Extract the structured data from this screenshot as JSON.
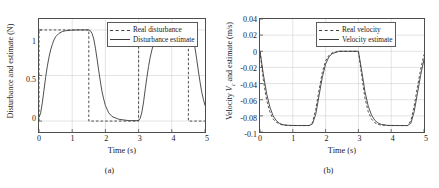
{
  "figure": {
    "panels": [
      {
        "id": "a",
        "caption": "(a)",
        "ylabel": "Disturbance and estimate (N)",
        "xlabel": "Time (s)",
        "yticks": [
          "0",
          "0.5",
          "1"
        ],
        "xticks": [
          "0",
          "1",
          "2",
          "3",
          "4",
          "5"
        ],
        "legend": [
          {
            "label": "Real disturbance",
            "style": "dashed"
          },
          {
            "label": "Disturbance estimate",
            "style": "solid"
          }
        ]
      },
      {
        "id": "b",
        "caption": "(b)",
        "ylabel_prefix": "Velocity ",
        "ylabel_symbol": "V",
        "ylabel_subscript": "c",
        "ylabel_suffix": " and estimate (m/s)",
        "xlabel": "Time (s)",
        "yticks": [
          "0.04",
          "0.02",
          "0",
          "-0.02",
          "-0.04",
          "-0.06",
          "-0.08",
          "-0.1"
        ],
        "xticks": [
          "0",
          "1",
          "2",
          "3",
          "4",
          "5"
        ],
        "legend": [
          {
            "label": "Real velocity",
            "style": "dashed"
          },
          {
            "label": "Velocity estimate",
            "style": "solid"
          }
        ]
      }
    ]
  },
  "colors": {
    "line": "#3c3c3c",
    "axis": "#4d4d4d",
    "grid": "#c8c8c8",
    "background": "#ffffff"
  },
  "chart_data": [
    {
      "type": "line",
      "title": "",
      "panel": "(a)",
      "xlabel": "Time (s)",
      "ylabel": "Disturbance and estimate (N)",
      "xlim": [
        0,
        5
      ],
      "ylim": [
        -0.12,
        1.12
      ],
      "xticks": [
        0,
        1,
        2,
        3,
        4,
        5
      ],
      "yticks": [
        0,
        0.5,
        1
      ],
      "grid": true,
      "legend_position": "top-right",
      "series": [
        {
          "name": "Real disturbance",
          "style": "dashed",
          "description": "Square wave: 1 on [0,1.5), 0 on [1.5,3), 1 on [3,4.5), 0 on [4.5,5]",
          "x": [
            0,
            0,
            1.5,
            1.5,
            3,
            3,
            4.5,
            4.5,
            5
          ],
          "y": [
            0,
            1,
            1,
            0,
            0,
            1,
            1,
            0,
            0
          ]
        },
        {
          "name": "Disturbance estimate",
          "style": "solid",
          "description": "Low-pass filtered square wave, rise/fall time about 0.55 s",
          "x": [
            0,
            0.05,
            0.1,
            0.15,
            0.2,
            0.25,
            0.3,
            0.35,
            0.4,
            0.45,
            0.5,
            0.6,
            0.7,
            0.8,
            1.0,
            1.2,
            1.5,
            1.55,
            1.6,
            1.65,
            1.7,
            1.75,
            1.8,
            1.85,
            1.9,
            1.95,
            2.0,
            2.1,
            2.2,
            2.4,
            2.7,
            3.0,
            3.05,
            3.1,
            3.15,
            3.2,
            3.25,
            3.3,
            3.35,
            3.4,
            3.45,
            3.5,
            3.6,
            3.7,
            3.9,
            4.2,
            4.5,
            4.55,
            4.6,
            4.65,
            4.7,
            4.75,
            4.8,
            4.85,
            4.9,
            4.95,
            5.0
          ],
          "y": [
            0.04,
            0.09,
            0.2,
            0.34,
            0.48,
            0.6,
            0.7,
            0.78,
            0.84,
            0.89,
            0.925,
            0.962,
            0.982,
            0.991,
            0.998,
            1.0,
            1.0,
            0.99,
            0.96,
            0.9,
            0.8,
            0.68,
            0.55,
            0.43,
            0.32,
            0.24,
            0.17,
            0.09,
            0.05,
            0.02,
            0.005,
            0.005,
            0.03,
            0.1,
            0.21,
            0.35,
            0.48,
            0.6,
            0.7,
            0.78,
            0.845,
            0.89,
            0.95,
            0.978,
            0.995,
            1.0,
            1.0,
            0.99,
            0.96,
            0.9,
            0.8,
            0.68,
            0.55,
            0.43,
            0.32,
            0.24,
            0.17
          ]
        }
      ]
    },
    {
      "type": "line",
      "title": "",
      "panel": "(b)",
      "xlabel": "Time (s)",
      "ylabel": "Velocity Vc and estimate (m/s)",
      "xlim": [
        0,
        5
      ],
      "ylim": [
        -0.1,
        0.04
      ],
      "xticks": [
        0,
        1,
        2,
        3,
        4,
        5
      ],
      "yticks": [
        0.04,
        0.02,
        0,
        -0.02,
        -0.04,
        -0.06,
        -0.08,
        -0.1
      ],
      "grid": true,
      "legend_position": "top-right",
      "series": [
        {
          "name": "Real velocity",
          "style": "dashed",
          "description": "Drops from 0 to -0.092 after each disturbance step, returns to 0",
          "x": [
            0,
            0.1,
            0.2,
            0.3,
            0.4,
            0.5,
            0.6,
            0.7,
            0.9,
            1.2,
            1.5,
            1.6,
            1.7,
            1.8,
            1.9,
            2.0,
            2.1,
            2.2,
            2.4,
            2.7,
            3.0,
            3.1,
            3.2,
            3.3,
            3.4,
            3.5,
            3.6,
            3.7,
            3.9,
            4.2,
            4.5,
            4.6,
            4.7,
            4.8,
            4.9,
            5.0
          ],
          "y": [
            0,
            -0.035,
            -0.06,
            -0.075,
            -0.084,
            -0.088,
            -0.09,
            -0.0915,
            -0.092,
            -0.092,
            -0.092,
            -0.088,
            -0.072,
            -0.048,
            -0.026,
            -0.012,
            -0.005,
            -0.002,
            0,
            0,
            0,
            -0.03,
            -0.058,
            -0.075,
            -0.084,
            -0.0885,
            -0.0905,
            -0.0915,
            -0.092,
            -0.092,
            -0.092,
            -0.086,
            -0.068,
            -0.044,
            -0.022,
            -0.004
          ]
        },
        {
          "name": "Velocity estimate",
          "style": "solid",
          "description": "Estimate tracks real velocity with small lag during transients",
          "x": [
            0,
            0.1,
            0.2,
            0.3,
            0.4,
            0.5,
            0.6,
            0.7,
            0.9,
            1.2,
            1.5,
            1.6,
            1.7,
            1.8,
            1.9,
            2.0,
            2.1,
            2.2,
            2.4,
            2.7,
            3.0,
            3.1,
            3.2,
            3.3,
            3.4,
            3.5,
            3.6,
            3.7,
            3.9,
            4.2,
            4.5,
            4.6,
            4.7,
            4.8,
            4.9,
            5.0
          ],
          "y": [
            0,
            -0.028,
            -0.052,
            -0.069,
            -0.08,
            -0.086,
            -0.0895,
            -0.091,
            -0.0918,
            -0.092,
            -0.092,
            -0.09,
            -0.078,
            -0.055,
            -0.032,
            -0.016,
            -0.007,
            -0.003,
            0,
            0,
            0,
            -0.024,
            -0.05,
            -0.068,
            -0.079,
            -0.0855,
            -0.089,
            -0.0906,
            -0.0918,
            -0.092,
            -0.092,
            -0.089,
            -0.075,
            -0.052,
            -0.029,
            -0.01
          ]
        }
      ]
    }
  ]
}
